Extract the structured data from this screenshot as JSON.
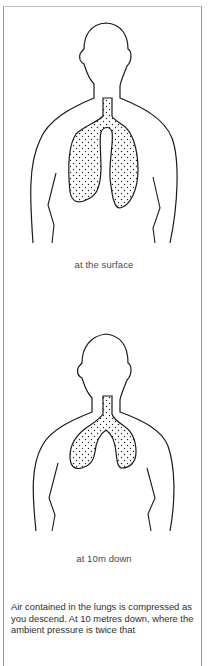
{
  "figures": [
    {
      "id": "surface",
      "caption": "at the surface",
      "lung_state": "full-volume"
    },
    {
      "id": "10m",
      "caption": "at 10m down",
      "lung_state": "compressed"
    }
  ],
  "body_text": {
    "paragraph": "Air contained in the lungs is compressed as you descend. At 10 metres down, where the ambient pressure is twice that"
  },
  "colors": {
    "outline": "#1a1a1a",
    "frame": "#9a9a9a",
    "text": "#3a3a3a"
  }
}
